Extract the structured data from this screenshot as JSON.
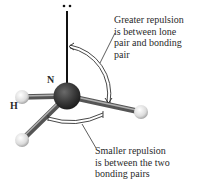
{
  "diagram": {
    "molecule": "NH3",
    "atoms": {
      "central": {
        "symbol": "N",
        "label": "N",
        "color": "#3a3a3a"
      },
      "hydrogen": {
        "symbol": "H",
        "label": "H",
        "color": "#e6e6e6"
      }
    },
    "lone_pair": {
      "symbol": "••"
    },
    "annotations": {
      "upper": {
        "text": "Greater repulsion\nis between lone\npair and bonding\npair"
      },
      "lower": {
        "text": "Smaller repulsion\nis between the two\nbonding pairs"
      }
    },
    "colors": {
      "bond": "#7a7a7a",
      "lone_pair_line": "#111111",
      "arc": "#333333",
      "text": "#2a2a2a"
    }
  }
}
